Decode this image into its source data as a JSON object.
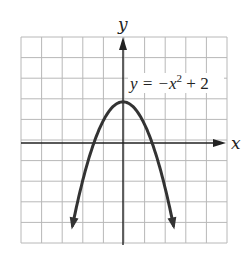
{
  "chart_data": {
    "type": "line",
    "title": "",
    "function": "y = -x^2 + 2",
    "annotation": {
      "text_main": "y = −x",
      "superscript": "2",
      "text_tail": " + 2"
    },
    "xlabel": "x",
    "ylabel": "y",
    "xlim": [
      -4,
      6
    ],
    "ylim": [
      -5,
      5
    ],
    "grid": true,
    "grid_step": 1,
    "vertex": [
      0,
      2
    ],
    "x_intercepts": [
      -1.414,
      1.414
    ],
    "x": [
      -2.4,
      -2,
      -1.5,
      -1,
      -0.5,
      0,
      0.5,
      1,
      1.5,
      2,
      2.4
    ],
    "y": [
      -3.76,
      -2,
      -0.25,
      1,
      1.75,
      2,
      1.75,
      1,
      -0.25,
      -2,
      -3.76
    ],
    "curve_color": "#333333",
    "grid_color": "#b8b8b8",
    "axis_color": "#222222"
  }
}
